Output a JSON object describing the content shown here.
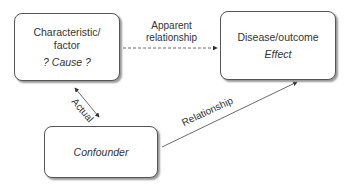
{
  "diagram": {
    "nodes": {
      "cause": {
        "line1": "Characteristic/",
        "line2": "factor",
        "role": "? Cause ?"
      },
      "effect": {
        "line1": "Disease/outcome",
        "role": "Effect"
      },
      "confounder": {
        "label": "Confounder"
      }
    },
    "edges": {
      "apparent": {
        "line1": "Apparent",
        "line2": "relationship",
        "style": "dashed"
      },
      "actual": {
        "label": "Actual",
        "style": "solid-bidirectional"
      },
      "relationship": {
        "label": "Relationship",
        "style": "solid"
      }
    }
  }
}
